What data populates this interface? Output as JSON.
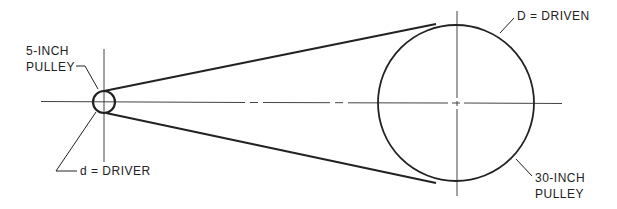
{
  "diagram": {
    "labels": {
      "small_pulley_line1": "5-INCH",
      "small_pulley_line2": "PULLEY",
      "driver": "d = DRIVER",
      "driven": "D = DRIVEN",
      "large_pulley_line1": "30-INCH",
      "large_pulley_line2": "PULLEY"
    },
    "small_pulley": {
      "cx": 104,
      "cy": 102,
      "r": 11,
      "size_inch": 5,
      "role": "driver"
    },
    "large_pulley": {
      "cx": 456,
      "cy": 103,
      "r": 78,
      "size_inch": 30,
      "role": "driven"
    },
    "colors": {
      "line": "#222222",
      "background": "#ffffff"
    }
  }
}
